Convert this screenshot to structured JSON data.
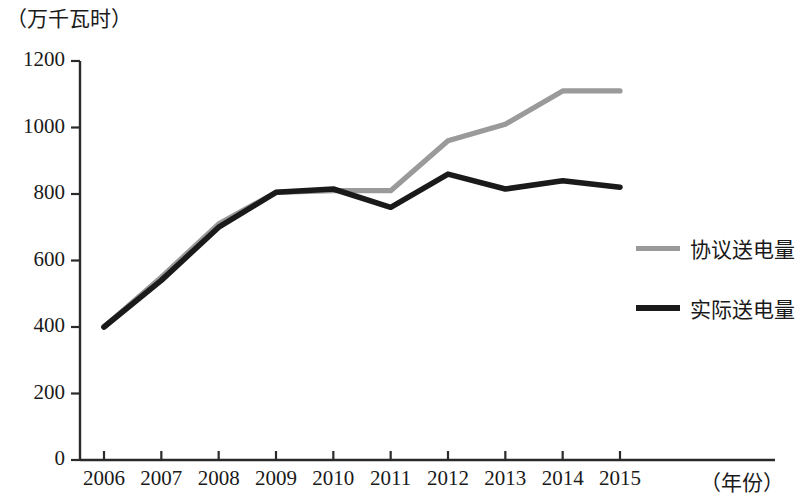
{
  "chart_data": {
    "type": "line",
    "title": "",
    "subtitle": "",
    "xlabel": "（年份）",
    "ylabel": "（万千瓦时）",
    "categories": [
      "2006",
      "2007",
      "2008",
      "2009",
      "2010",
      "2011",
      "2012",
      "2013",
      "2014",
      "2015"
    ],
    "x": [
      2006,
      2007,
      2008,
      2009,
      2010,
      2011,
      2012,
      2013,
      2014,
      2015
    ],
    "series": [
      {
        "name": "协议送电量",
        "color": "#9a9a9a",
        "values": [
          400,
          550,
          710,
          805,
          810,
          810,
          960,
          1010,
          1110,
          1110
        ]
      },
      {
        "name": "实际送电量",
        "color": "#1a1a1a",
        "values": [
          400,
          540,
          700,
          805,
          815,
          760,
          860,
          815,
          840,
          820
        ]
      }
    ],
    "ylim": [
      0,
      1200
    ],
    "yticks": [
      0,
      200,
      400,
      600,
      800,
      1000,
      1200
    ],
    "ytick_labels": [
      "0",
      "200",
      "400",
      "600",
      "800",
      "1000",
      "1200"
    ],
    "xlim": [
      2006,
      2015
    ],
    "grid": false,
    "legend_position": "right"
  },
  "axes": {
    "y_unit_caption": "（万千瓦时）",
    "x_title": "（年份）"
  },
  "legend": {
    "entries": [
      {
        "label": "协议送电量",
        "color": "#9a9a9a"
      },
      {
        "label": "实际送电量",
        "color": "#1a1a1a"
      }
    ]
  }
}
